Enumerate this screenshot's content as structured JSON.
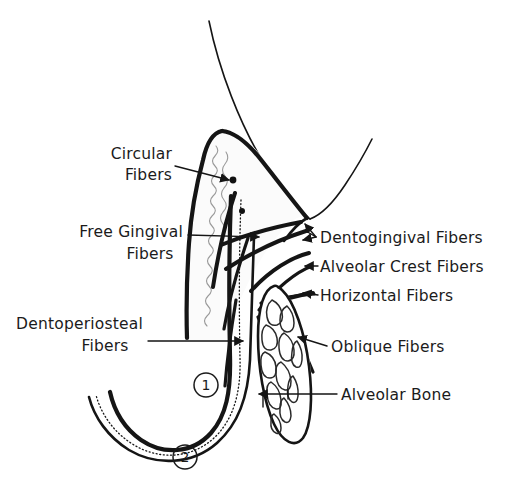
{
  "figure": {
    "ink_color": "#151515",
    "background_color": "#ffffff"
  },
  "labels": {
    "circular_fibers": {
      "line1": "Circular",
      "line2": "Fibers"
    },
    "free_gingival_fibers": {
      "line1": "Free Gingival",
      "line2": "Fibers"
    },
    "dentoperiosteal_fibers": {
      "line1": "Dentoperiosteal",
      "line2": "Fibers"
    },
    "dentogingival_fibers": {
      "line1": "Dentogingival  Fibers"
    },
    "alveolar_crest_fibers": {
      "line1": "Alveolar  Crest  Fibers"
    },
    "horizontal_fibers": {
      "line1": "Horizontal  Fibers"
    },
    "oblique_fibers": {
      "line1": "Oblique  Fibers"
    },
    "alveolar_bone": {
      "line1": "Alveolar  Bone"
    }
  },
  "markers": [
    {
      "name": "marker-one",
      "value": "1"
    },
    {
      "name": "marker-two",
      "value": "2"
    }
  ]
}
